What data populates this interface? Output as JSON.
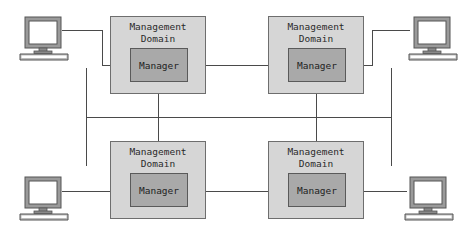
{
  "diagram": {
    "type": "network-management-topology",
    "colors": {
      "domain_fill": "#d6d6d6",
      "manager_fill": "#a9a9a9",
      "line": "#4a4a4a",
      "monitor_frame": "#9a9a9a",
      "monitor_screen": "#ffffff"
    },
    "domains": [
      {
        "position": "top-left",
        "label": "Management\nDomain",
        "manager_label": "Manager"
      },
      {
        "position": "top-right",
        "label": "Management\nDomain",
        "manager_label": "Manager"
      },
      {
        "position": "bottom-left",
        "label": "Management\nDomain",
        "manager_label": "Manager"
      },
      {
        "position": "bottom-right",
        "label": "Management\nDomain",
        "manager_label": "Manager"
      }
    ],
    "workstations": [
      {
        "position": "top-left",
        "icon": "computer-icon"
      },
      {
        "position": "top-right",
        "icon": "computer-icon"
      },
      {
        "position": "bottom-left",
        "icon": "computer-icon"
      },
      {
        "position": "bottom-right",
        "icon": "computer-icon"
      }
    ]
  }
}
